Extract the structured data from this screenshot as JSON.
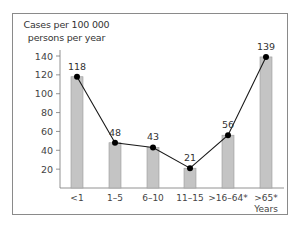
{
  "chart_data": {
    "type": "bar",
    "title": "",
    "ylabel": "Cases per 100 000 persons per year",
    "ylabel_lines": [
      "Cases per 100 000",
      "persons per year"
    ],
    "xlabel": "Years",
    "categories": [
      "<1",
      "1–5",
      "6–10",
      "11–15",
      ">16–64*",
      ">65*"
    ],
    "values": [
      118,
      48,
      43,
      21,
      56,
      139
    ],
    "overlay_line": true,
    "y_ticks": [
      20,
      40,
      60,
      80,
      100,
      120,
      140
    ],
    "ylim": [
      0,
      145
    ],
    "grid": false,
    "legend": null,
    "colors": {
      "bar": "#c4c4c4",
      "bar_border": "#9a9a9a",
      "line": "#1a1a1a",
      "marker": "#000000"
    }
  }
}
